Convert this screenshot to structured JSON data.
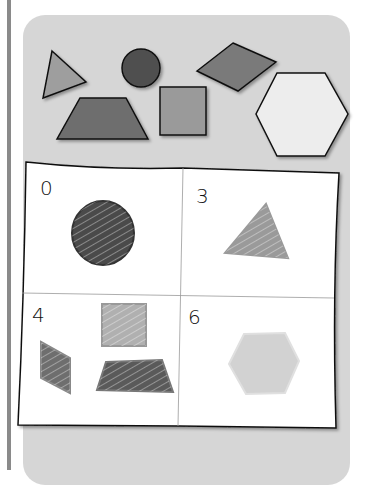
{
  "colors": {
    "triangle": "#9e9e9e",
    "circle": "#505050",
    "rhombus": "#7a7a7a",
    "trapezoid": "#6e6e6e",
    "square": "#9a9a9a",
    "hexagon": "#ededed",
    "panel": "#d6d6d6"
  },
  "shapes_top": [
    "triangle",
    "circle",
    "rhombus",
    "trapezoid",
    "square",
    "hexagon"
  ],
  "quadrants": [
    {
      "count": "0",
      "shapes": [
        "circle"
      ]
    },
    {
      "count": "3",
      "shapes": [
        "triangle"
      ]
    },
    {
      "count": "4",
      "shapes": [
        "square",
        "rhombus",
        "trapezoid"
      ]
    },
    {
      "count": "6",
      "shapes": [
        "hexagon"
      ]
    }
  ]
}
